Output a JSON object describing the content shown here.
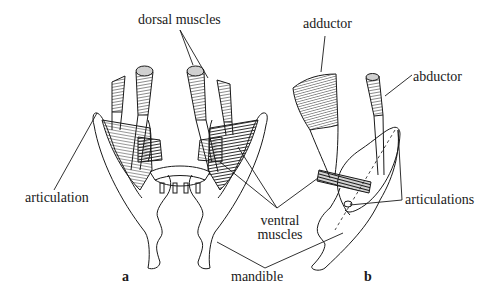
{
  "figure": {
    "panels": [
      {
        "id": "a",
        "label": "a"
      },
      {
        "id": "b",
        "label": "b"
      }
    ],
    "labels": {
      "dorsal_muscles": "dorsal muscles",
      "adductor": "adductor",
      "abductor": "abductor",
      "articulation": "articulation",
      "articulations": "articulations",
      "ventral_muscles_line1": "ventral",
      "ventral_muscles_line2": "muscles",
      "mandible": "mandible"
    },
    "colors": {
      "ink": "#1a1a1a",
      "background": "#ffffff",
      "muscle_tip": "#d0d0d0"
    }
  }
}
